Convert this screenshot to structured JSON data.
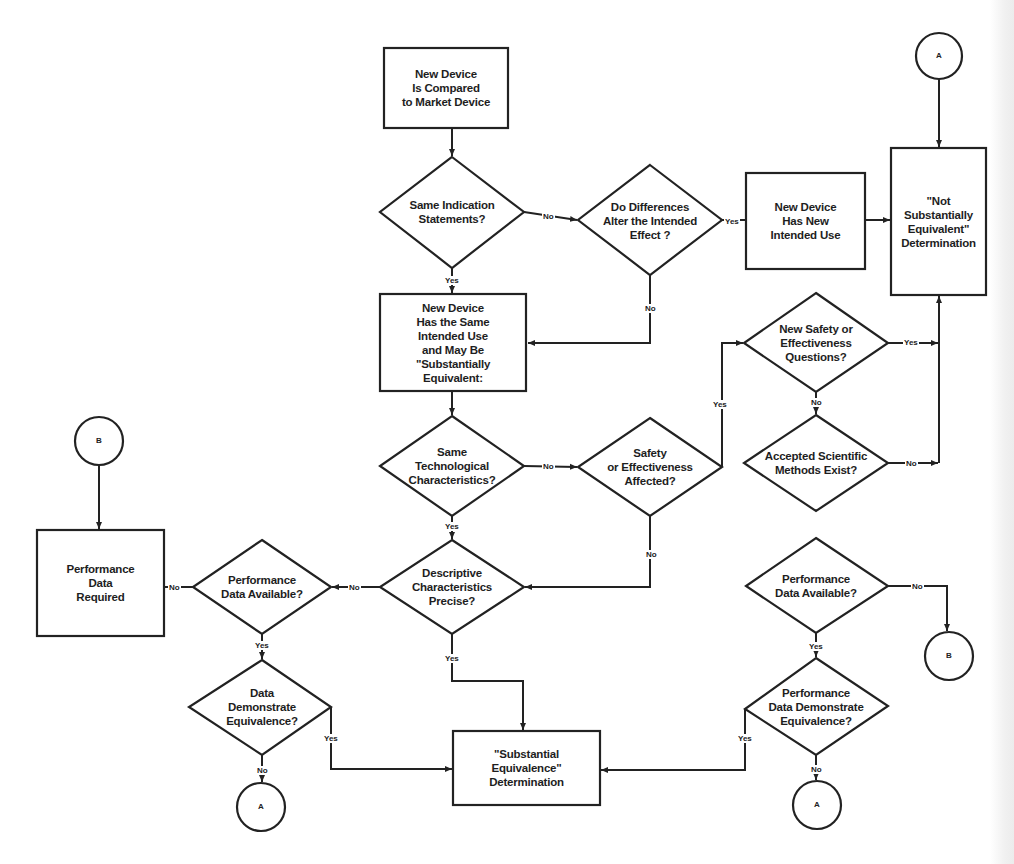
{
  "diagram": {
    "type": "flowchart",
    "title": "",
    "colors": {
      "line": "#222222",
      "fill": "#ffffff",
      "text": "#1e1e1e"
    }
  },
  "nodes": {
    "compare": {
      "shape": "rect",
      "label": "New Device\nIs Compared\nto Market Device"
    },
    "same_indication": {
      "shape": "diamond",
      "label": "Same Indication\nStatements?"
    },
    "differences_alter": {
      "shape": "diamond",
      "label": "Do Differences\nAlter the Intended\nEffect ?"
    },
    "new_intended_use": {
      "shape": "rect",
      "label": "New Device\nHas New\nIntended Use"
    },
    "not_se": {
      "shape": "rect",
      "label": "\"Not\nSubstantially\nEquivalent\"\nDetermination"
    },
    "same_intended_use": {
      "shape": "rect",
      "label": "New Device\nHas the Same\nIntended Use\nand May Be\n\"Substantially\nEquivalent:"
    },
    "new_safety_questions": {
      "shape": "diamond",
      "label": "New Safety or\nEffectiveness\nQuestions?"
    },
    "accepted_methods": {
      "shape": "diamond",
      "label": "Accepted Scientific\nMethods Exist?"
    },
    "same_tech": {
      "shape": "diamond",
      "label": "Same\nTechnological\nCharacteristics?"
    },
    "safety_affected": {
      "shape": "diamond",
      "label": "Safety\nor Effectiveness\nAffected?"
    },
    "descriptive_precise": {
      "shape": "diamond",
      "label": "Descriptive\nCharacteristics\nPrecise?"
    },
    "perf_available_left": {
      "shape": "diamond",
      "label": "Performance\nData Available?"
    },
    "perf_required": {
      "shape": "rect",
      "label": "Performance\nData\nRequired"
    },
    "data_demonstrate": {
      "shape": "diamond",
      "label": "Data\nDemonstrate\nEquivalence?"
    },
    "se_determination": {
      "shape": "rect",
      "label": "\"Substantial\nEquivalence\"\nDetermination"
    },
    "perf_available_right": {
      "shape": "diamond",
      "label": "Performance\nData Available?"
    },
    "perf_data_demonstrate": {
      "shape": "diamond",
      "label": "Performance\nData Demonstrate\nEquivalence?"
    }
  },
  "connectors": {
    "a_top": "A",
    "b_left": "B",
    "a_bottom_left": "A",
    "b_right": "B",
    "a_bottom_right": "A"
  },
  "edge_labels": {
    "same_indication_no": "No",
    "same_indication_yes": "Yes",
    "differences_yes": "Yes",
    "differences_no": "No",
    "safety_affected_yes": "Yes",
    "new_safety_yes": "Yes",
    "new_safety_no": "No",
    "accepted_methods_no": "No",
    "same_tech_no": "No",
    "same_tech_yes": "Yes",
    "safety_affected_no": "No",
    "descriptive_no": "No",
    "descriptive_yes": "Yes",
    "perf_left_no": "No",
    "perf_left_yes": "Yes",
    "data_demo_yes": "Yes",
    "data_demo_no": "No",
    "perf_right_no": "No",
    "perf_right_yes": "Yes",
    "perf_demo_yes": "Yes",
    "perf_demo_no": "No"
  }
}
